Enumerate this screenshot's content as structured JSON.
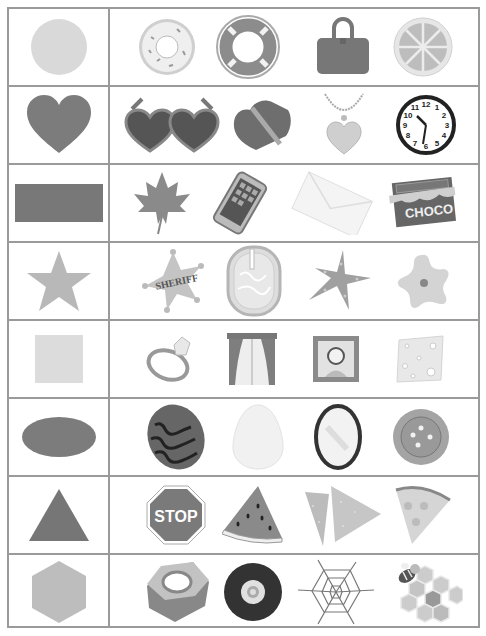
{
  "worksheet": {
    "rows": [
      {
        "shape": "circle",
        "objects": [
          "donut",
          "life-ring",
          "handbag",
          "lemon-slice"
        ]
      },
      {
        "shape": "heart",
        "objects": [
          "heart-sunglasses",
          "heart-chocolate-box",
          "heart-necklace",
          "wall-clock"
        ]
      },
      {
        "shape": "rectangle",
        "objects": [
          "maple-leaf",
          "smartphone",
          "envelope",
          "chocolate-bar"
        ]
      },
      {
        "shape": "star",
        "objects": [
          "sheriff-badge",
          "pool",
          "starfish",
          "star-cookie"
        ]
      },
      {
        "shape": "square",
        "objects": [
          "diamond-ring",
          "window",
          "picture-frame",
          "cheese-slice"
        ]
      },
      {
        "shape": "oval",
        "objects": [
          "watermelon",
          "egg",
          "mirror",
          "button"
        ]
      },
      {
        "shape": "triangle",
        "objects": [
          "stop-sign",
          "watermelon-slice",
          "tortilla-chips",
          "pizza-slice"
        ]
      },
      {
        "shape": "hexagon",
        "objects": [
          "hex-nut",
          "tire",
          "spider-web",
          "honeycomb-bee"
        ]
      }
    ],
    "text": {
      "chocolate_label": "CHOCO",
      "sheriff_label": "SHERIFF",
      "stop_label": "STOP",
      "clock_numbers": [
        "12",
        "1",
        "2",
        "3",
        "4",
        "5",
        "6",
        "7",
        "8",
        "9",
        "10",
        "11"
      ]
    }
  }
}
